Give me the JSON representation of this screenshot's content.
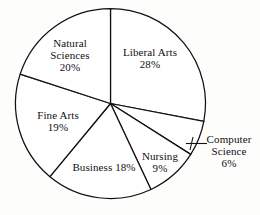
{
  "chart_data": {
    "type": "pie",
    "title": "",
    "units": "percent",
    "start_angle_deg": 0,
    "direction": "clockwise",
    "legend": "none",
    "labels_inside": true,
    "categories": [
      "Liberal Arts",
      "Computer Science",
      "Nursing",
      "Business",
      "Fine Arts",
      "Natural Sciences"
    ],
    "values": [
      28,
      6,
      9,
      18,
      19,
      20
    ],
    "slices": [
      {
        "name": "Liberal Arts",
        "value": 28,
        "value_label": "28%",
        "label_layout": "stacked",
        "leader_line": false
      },
      {
        "name": "Computer Science",
        "value": 6,
        "value_label": "6%",
        "label_layout": "stacked",
        "leader_line": true
      },
      {
        "name": "Nursing",
        "value": 9,
        "value_label": "9%",
        "label_layout": "stacked",
        "leader_line": false
      },
      {
        "name": "Business",
        "value": 18,
        "value_label": "18%",
        "label_layout": "inline",
        "leader_line": false
      },
      {
        "name": "Fine Arts",
        "value": 19,
        "value_label": "19%",
        "label_layout": "stacked",
        "leader_line": false
      },
      {
        "name": "Natural Sciences",
        "value": 20,
        "value_label": "20%",
        "label_layout": "stacked",
        "leader_line": false
      }
    ],
    "style": {
      "fill": "#ffffff",
      "stroke": "#111111",
      "background": "#fdfdfc"
    }
  },
  "labels": {
    "natural_sciences": {
      "line1": "Natural",
      "line2": "Sciences",
      "value": "20%"
    },
    "liberal_arts": {
      "line1": "Liberal Arts",
      "value": "28%"
    },
    "fine_arts": {
      "line1": "Fine Arts",
      "value": "19%"
    },
    "business": {
      "line1": "Business",
      "value": "18%"
    },
    "nursing": {
      "line1": "Nursing",
      "value": "9%"
    },
    "computer_science": {
      "line1": "Computer",
      "line2": "Science",
      "value": "6%"
    }
  }
}
